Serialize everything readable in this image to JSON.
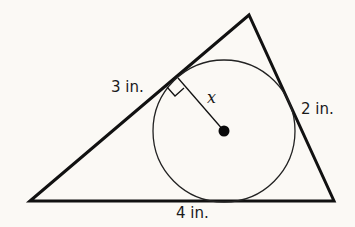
{
  "diagram": {
    "type": "geometry",
    "triangle": {
      "vertices": [
        [
          30,
          201
        ],
        [
          249,
          15
        ],
        [
          334,
          201
        ]
      ],
      "stroke": "#111111"
    },
    "circle": {
      "center": [
        224,
        131
      ],
      "radius": 71,
      "stroke": "#222222"
    },
    "labels": {
      "left_side": "3 in.",
      "right_side": "2 in.",
      "bottom_side": "4 in.",
      "radius": "x"
    },
    "annotations": {
      "right_angle_marker": true,
      "center_dot": true
    }
  }
}
